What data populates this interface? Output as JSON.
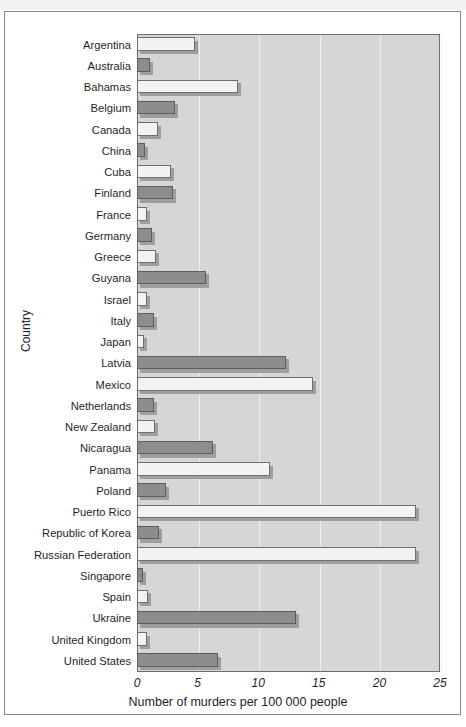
{
  "figure": {
    "top_strip_text": "",
    "y_axis_label": "Country",
    "x_axis_label": "Number of murders per 100 000 people"
  },
  "chart_data": {
    "type": "bar",
    "orientation": "horizontal",
    "title": "",
    "xlabel": "Number of murders per 100 000 people",
    "ylabel": "Country",
    "xlim": [
      0,
      25
    ],
    "xticks": [
      0,
      5,
      10,
      15,
      20,
      25
    ],
    "xticklabels": [
      "0",
      "5",
      "10",
      "15",
      "20",
      "25"
    ],
    "grid": true,
    "legend": "none",
    "bar_colors": {
      "light": "#f2f2f2",
      "dark": "#8d8d8d",
      "plot_background": "#d6d6d6",
      "gridline": "#efefef",
      "axis_border": "#6d6d6d"
    },
    "categories": [
      "Argentina",
      "Australia",
      "Bahamas",
      "Belgium",
      "Canada",
      "China",
      "Cuba",
      "Finland",
      "France",
      "Germany",
      "Greece",
      "Guyana",
      "Israel",
      "Italy",
      "Japan",
      "Latvia",
      "Mexico",
      "Netherlands",
      "New Zealand",
      "Nicaragua",
      "Panama",
      "Poland",
      "Puerto Rico",
      "Republic of Korea",
      "Russian Federation",
      "Singapore",
      "Spain",
      "Ukraine",
      "United Kingdom",
      "United States"
    ],
    "values": [
      4.8,
      1.1,
      8.3,
      3.1,
      1.7,
      0.7,
      2.8,
      3.0,
      0.8,
      1.2,
      1.6,
      5.7,
      0.8,
      1.4,
      0.6,
      12.3,
      14.5,
      1.4,
      1.5,
      6.3,
      11.0,
      2.4,
      23.0,
      1.8,
      23.0,
      0.5,
      0.9,
      13.1,
      0.8,
      6.7
    ],
    "bar_styles": [
      "light",
      "dark",
      "light",
      "dark",
      "light",
      "dark",
      "light",
      "dark",
      "light",
      "dark",
      "light",
      "dark",
      "light",
      "dark",
      "light",
      "dark",
      "light",
      "dark",
      "light",
      "dark",
      "light",
      "dark",
      "light",
      "dark",
      "light",
      "dark",
      "light",
      "dark",
      "light",
      "dark"
    ]
  }
}
